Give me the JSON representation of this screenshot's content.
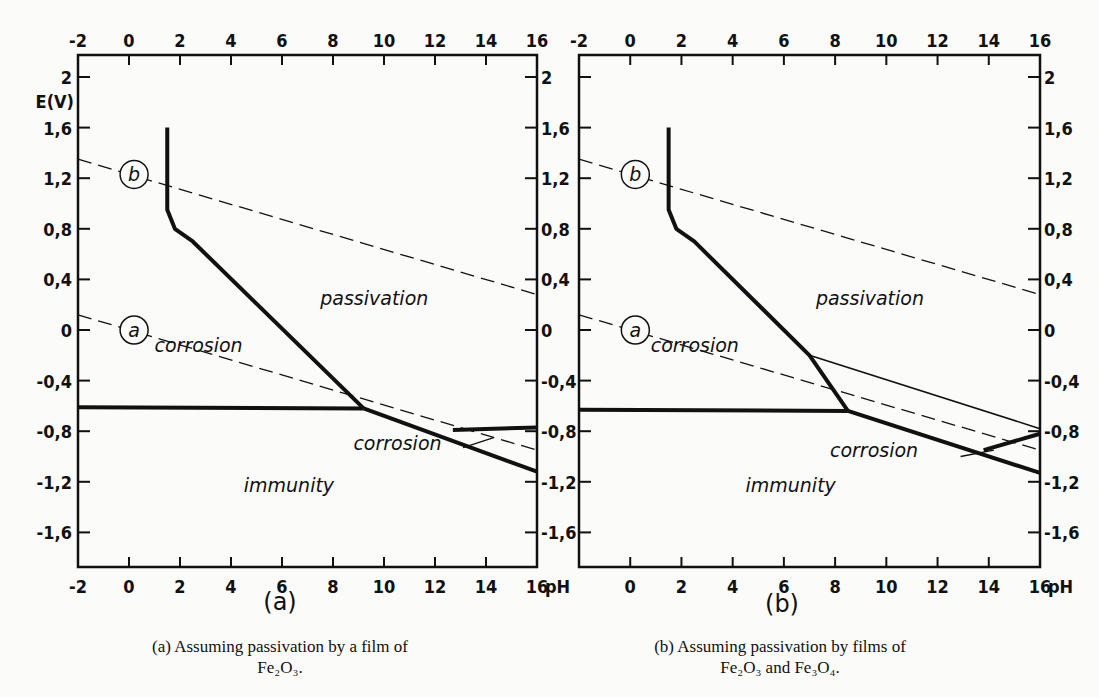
{
  "chart_data": [
    {
      "type": "line",
      "panel": "(a)",
      "title": "Assuming passivation by a film of Fe2O3.",
      "xlabel": "pH",
      "ylabel": "E(V)",
      "xlim": [
        -2,
        16
      ],
      "ylim": [
        -1.8,
        2.2
      ],
      "x_ticks": [
        "-2",
        "0",
        "2",
        "4",
        "6",
        "8",
        "10",
        "12",
        "14",
        "16"
      ],
      "y_ticks": [
        "2",
        "1,6",
        "1,2",
        "0,8",
        "0,4",
        "0",
        "-0,4",
        "-0,8",
        "-1,2",
        "-1,6"
      ],
      "grid": false,
      "series": [
        {
          "name": "b (O2/H2O)",
          "style": "dashed",
          "x": [
            -2,
            16
          ],
          "y": [
            1.35,
            0.28
          ]
        },
        {
          "name": "a (H2/H+)",
          "style": "dashed",
          "x": [
            -2,
            16
          ],
          "y": [
            0.12,
            -0.95
          ]
        },
        {
          "name": "passivation boundary",
          "style": "thick",
          "x": [
            1.5,
            1.5,
            1.8,
            2.5,
            9.2
          ],
          "y": [
            1.6,
            0.95,
            0.8,
            0.7,
            -0.62
          ]
        },
        {
          "name": "immunity boundary (acid)",
          "style": "thick",
          "x": [
            -2,
            9.2
          ],
          "y": [
            -0.61,
            -0.62
          ]
        },
        {
          "name": "immunity boundary (alkaline)",
          "style": "thick",
          "x": [
            9.2,
            16
          ],
          "y": [
            -0.62,
            -1.12
          ]
        },
        {
          "name": "passivation boundary (alkaline)",
          "style": "thick",
          "x": [
            12.7,
            16
          ],
          "y": [
            -0.79,
            -0.77
          ]
        }
      ],
      "annotations": [
        "b",
        "a",
        "passivation",
        "corrosion",
        "corrosion",
        "immunity"
      ]
    },
    {
      "type": "line",
      "panel": "(b)",
      "title": "Assuming passivation by films of Fe2O3 and Fe3O4.",
      "xlabel": "pH",
      "ylabel": "E(V)",
      "xlim": [
        -2,
        16
      ],
      "ylim": [
        -1.8,
        2.2
      ],
      "x_ticks": [
        "-2",
        "0",
        "2",
        "4",
        "6",
        "8",
        "10",
        "12",
        "14",
        "16"
      ],
      "y_ticks": [
        "2",
        "1,6",
        "1,2",
        "0,8",
        "0,4",
        "0",
        "-0,4",
        "-0,8",
        "-1,2",
        "-1,6"
      ],
      "grid": false,
      "series": [
        {
          "name": "b (O2/H2O)",
          "style": "dashed",
          "x": [
            -2,
            16
          ],
          "y": [
            1.35,
            0.28
          ]
        },
        {
          "name": "a (H2/H+)",
          "style": "dashed",
          "x": [
            -2,
            16
          ],
          "y": [
            0.12,
            -0.95
          ]
        },
        {
          "name": "passivation boundary",
          "style": "thick",
          "x": [
            1.5,
            1.5,
            1.8,
            2.5,
            7,
            8.5
          ],
          "y": [
            1.6,
            0.95,
            0.8,
            0.7,
            -0.2,
            -0.64
          ]
        },
        {
          "name": "Fe2O3/Fe3O4 boundary",
          "style": "thin",
          "x": [
            7,
            16
          ],
          "y": [
            -0.2,
            -0.78
          ]
        },
        {
          "name": "immunity boundary (acid)",
          "style": "thick",
          "x": [
            -2,
            8.5
          ],
          "y": [
            -0.63,
            -0.64
          ]
        },
        {
          "name": "immunity boundary (alkaline)",
          "style": "thick",
          "x": [
            8.5,
            16
          ],
          "y": [
            -0.64,
            -1.13
          ]
        },
        {
          "name": "passivation boundary (alkaline)",
          "style": "thick",
          "x": [
            13.8,
            16
          ],
          "y": [
            -0.95,
            -0.82
          ]
        }
      ],
      "annotations": [
        "b",
        "a",
        "passivation",
        "corrosion",
        "corrosion",
        "immunity"
      ]
    }
  ],
  "figure": {
    "ylabel": "E(V)",
    "xunit": "pH",
    "x_ticks": [
      "-2",
      "0",
      "2",
      "4",
      "6",
      "8",
      "10",
      "12",
      "14",
      "16"
    ],
    "y_ticks_left": [
      "2",
      "1,6",
      "1,2",
      "0,8",
      "0,4",
      "0",
      "-0,4",
      "-0,8",
      "-1,2",
      "-1,6"
    ],
    "y_ticks_right": [
      "2",
      "1,6",
      "1,2",
      "0,8",
      "0,4",
      "0",
      "-0,4",
      "-0,8",
      "-1,2",
      "-1,6"
    ],
    "labels": {
      "b": "b",
      "a": "a",
      "passivation": "passivation",
      "corrosion": "corrosion",
      "immunity": "immunity"
    },
    "panel_a": {
      "sublabel": "(a)",
      "caption_line1": "(a) Assuming passivation by a film of",
      "caption_line2": "Fe₂O₃."
    },
    "panel_b": {
      "sublabel": "(b)",
      "caption_line1": "(b) Assuming passivation by films of",
      "caption_line2": "Fe₂O₃ and Fe₃O₄."
    }
  }
}
